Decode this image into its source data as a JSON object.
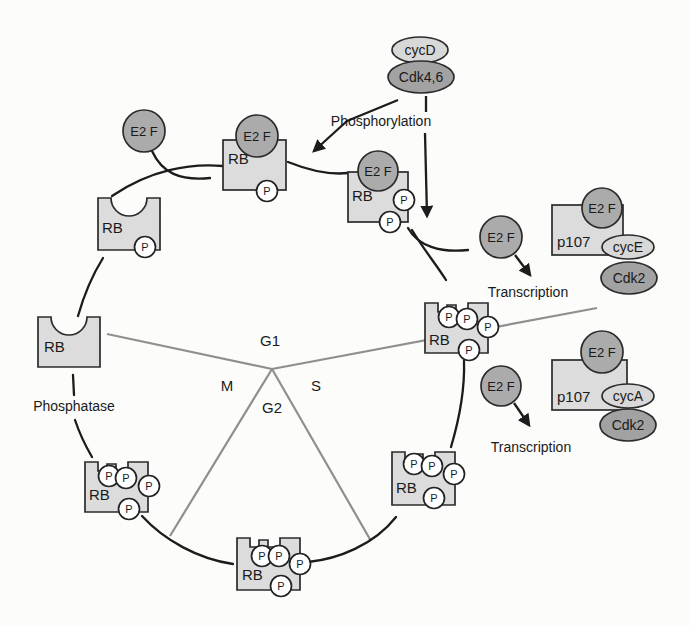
{
  "figure": {
    "type": "cell-cycle-rb-phosphorylation-diagram"
  },
  "colors": {
    "background": "#fcfcfa",
    "rb_box_fill": "#dcdcdc",
    "e2f_fill": "#ababab",
    "cyclin_fill": "#d8d8d8",
    "cdk_fill": "#a2a2a2",
    "phosphate_fill": "#ffffff",
    "outline": "#2b2b2b",
    "cycle_arc": "#1c1c1c",
    "phase_line": "#8f8f8f"
  },
  "phases": {
    "g1": "G1",
    "s": "S",
    "g2": "G2",
    "m": "M"
  },
  "process_labels": {
    "phosphorylation": "Phosphorylation",
    "phosphatase": "Phosphatase",
    "transcription_1": "Transcription",
    "transcription_2": "Transcription"
  },
  "molecules": {
    "rb": "RB",
    "e2f": "E2 F",
    "p": "P",
    "p107": "p107",
    "cycD": "cycD",
    "cdk46": "Cdk4,6",
    "cycE": "cycE",
    "cdk2": "Cdk2",
    "cycA": "cycA"
  }
}
